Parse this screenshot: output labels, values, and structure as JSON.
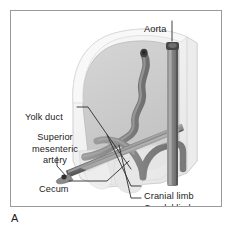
{
  "figure": {
    "panel_letter": "A",
    "border_color": "#9a9a9a",
    "background_color": "#ffffff",
    "text_color": "#1b1b1b"
  },
  "labels": {
    "aorta": "Aorta",
    "yolk_duct": "Yolk duct",
    "superior_mesenteric_artery_line1": "Superior",
    "superior_mesenteric_artery_line2": "mesenteric",
    "superior_mesenteric_artery_line3": "artery",
    "cecum": "Cecum",
    "cranial_limb": "Cranial limb",
    "caudal_limb": "Caudal limb"
  },
  "illustration": {
    "description": "Cutaway three-dimensional drawing of an embryonic abdominal cavity showing the midgut loop, its cranial and caudal limbs, the superior mesenteric artery and the dorsal aorta",
    "colors": {
      "body_wall_outer": "#f2f2f2",
      "body_wall_edge": "#d8d8d8",
      "cavity_fill": "#d0d0d0",
      "cavity_shadow": "#bdbdbd",
      "gut_loop": "#8f8f8f",
      "gut_loop_shade": "#6e6e6e",
      "artery": "#7c7c7c",
      "artery_shade": "#5a5a5a",
      "aorta": "#8a8a8a",
      "aorta_shade": "#6a6a6a",
      "aorta_cap": "#4a4a4a",
      "duct_tip": "#3a3a3a",
      "leader_line": "#3a3a3a",
      "translucent": "#e6e6e6"
    },
    "structures": [
      "body wall cutaway",
      "peritoneal cavity",
      "dorsal aorta",
      "superior mesenteric artery",
      "midgut cranial limb",
      "midgut caudal limb",
      "cecal bud",
      "yolk duct (vitelline duct) attachment"
    ]
  }
}
